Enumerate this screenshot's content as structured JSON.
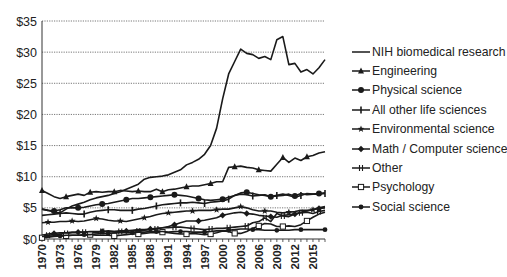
{
  "chart_data": {
    "type": "line",
    "title": "",
    "xlabel": "",
    "ylabel": "",
    "ylim": [
      0,
      35
    ],
    "y_ticks": [
      "$0",
      "$5",
      "$10",
      "$15",
      "$20",
      "$25",
      "$30",
      "$35"
    ],
    "y_tick_values": [
      0,
      5,
      10,
      15,
      20,
      25,
      30,
      35
    ],
    "x_tick_labels": [
      "1970",
      "1973",
      "1976",
      "1979",
      "1982",
      "1985",
      "1988",
      "1991",
      "1994",
      "1997",
      "2000",
      "2003",
      "2006",
      "2009",
      "2012",
      "2015"
    ],
    "grid": "horizontal dotted",
    "legend_position": "right",
    "x": [
      1970,
      1971,
      1972,
      1973,
      1974,
      1975,
      1976,
      1977,
      1978,
      1979,
      1980,
      1981,
      1982,
      1983,
      1984,
      1985,
      1986,
      1987,
      1988,
      1989,
      1990,
      1991,
      1992,
      1993,
      1994,
      1995,
      1996,
      1997,
      1998,
      1999,
      2000,
      2001,
      2002,
      2003,
      2004,
      2005,
      2006,
      2007,
      2008,
      2009,
      2010,
      2011,
      2012,
      2013,
      2014,
      2015,
      2016,
      2017
    ],
    "series": [
      {
        "name": "NIH biomedical research",
        "marker": "none",
        "values": [
          4.8,
          4.6,
          4.3,
          4.2,
          4.8,
          5.3,
          5.6,
          5.9,
          6.3,
          6.6,
          6.8,
          7.0,
          7.3,
          7.6,
          8.0,
          8.4,
          8.8,
          9.6,
          9.9,
          10.0,
          10.1,
          10.3,
          10.7,
          11.1,
          11.9,
          12.3,
          12.8,
          13.6,
          15.0,
          17.8,
          22.5,
          26.5,
          28.5,
          30.5,
          29.8,
          29.6,
          29.0,
          29.3,
          28.8,
          32.0,
          32.5,
          28.0,
          28.2,
          26.8,
          27.2,
          26.5,
          27.5,
          28.8
        ]
      },
      {
        "name": "Engineering",
        "marker": "triangle",
        "values": [
          7.8,
          7.3,
          6.8,
          6.5,
          6.8,
          7.0,
          7.2,
          7.0,
          7.5,
          7.6,
          7.5,
          7.6,
          7.6,
          7.8,
          7.7,
          7.6,
          7.7,
          7.6,
          7.6,
          8.0,
          7.6,
          7.9,
          8.0,
          8.2,
          8.4,
          8.5,
          8.5,
          8.7,
          8.9,
          9.2,
          9.2,
          11.5,
          11.6,
          11.7,
          11.5,
          11.4,
          11.1,
          11.0,
          10.9,
          12.0,
          13.1,
          12.3,
          13.0,
          12.6,
          13.2,
          13.4,
          13.8,
          14.0
        ]
      },
      {
        "name": "Physical science",
        "marker": "circle",
        "values": [
          4.8,
          4.6,
          4.5,
          4.7,
          5.0,
          5.0,
          5.0,
          5.1,
          5.3,
          5.5,
          5.6,
          5.7,
          5.9,
          6.1,
          6.3,
          6.5,
          6.5,
          6.6,
          6.7,
          6.8,
          6.9,
          7.0,
          7.1,
          7.0,
          6.9,
          6.7,
          6.5,
          6.3,
          6.2,
          6.3,
          6.4,
          6.7,
          7.0,
          7.4,
          7.5,
          7.3,
          7.1,
          7.0,
          6.8,
          6.9,
          7.0,
          7.2,
          6.9,
          7.3,
          7.1,
          7.2,
          7.3,
          7.4
        ]
      },
      {
        "name": "All other life sciences",
        "marker": "plus",
        "values": [
          3.8,
          3.9,
          4.0,
          4.1,
          4.2,
          4.1,
          4.0,
          4.0,
          4.3,
          4.5,
          4.6,
          4.7,
          4.7,
          4.6,
          4.6,
          4.6,
          4.8,
          4.9,
          5.1,
          5.3,
          5.5,
          5.6,
          5.7,
          5.8,
          5.8,
          5.9,
          5.8,
          5.7,
          5.9,
          6.0,
          6.1,
          6.4,
          7.0,
          7.2,
          7.1,
          6.9,
          7.0,
          7.1,
          6.8,
          7.0,
          7.2,
          7.0,
          6.7,
          7.0,
          7.3,
          7.2,
          7.2,
          7.3
        ]
      },
      {
        "name": "Environmental science",
        "marker": "star",
        "values": [
          2.6,
          2.7,
          2.7,
          2.8,
          2.8,
          2.9,
          2.8,
          2.9,
          3.1,
          3.3,
          3.2,
          3.0,
          2.9,
          2.9,
          2.8,
          3.0,
          3.2,
          3.4,
          3.6,
          3.9,
          4.1,
          4.2,
          4.3,
          4.4,
          4.5,
          4.5,
          4.6,
          4.6,
          4.6,
          4.7,
          4.8,
          4.8,
          5.0,
          5.2,
          5.0,
          4.7,
          4.5,
          4.5,
          4.5,
          4.3,
          4.2,
          4.3,
          4.4,
          4.6,
          4.6,
          4.7,
          5.0,
          5.2
        ]
      },
      {
        "name": "Math / Computer science",
        "marker": "diamond",
        "values": [
          0.6,
          0.8,
          0.9,
          1.0,
          1.0,
          1.1,
          1.1,
          1.1,
          1.2,
          1.2,
          1.2,
          1.2,
          1.2,
          1.3,
          1.3,
          1.4,
          1.5,
          1.5,
          1.6,
          1.7,
          1.8,
          2.0,
          2.3,
          2.6,
          2.9,
          2.9,
          2.9,
          3.0,
          3.2,
          3.4,
          3.8,
          4.0,
          4.2,
          4.3,
          4.1,
          4.0,
          3.8,
          3.7,
          3.6,
          3.5,
          3.8,
          3.9,
          4.0,
          4.3,
          4.5,
          4.7,
          4.9,
          5.0
        ]
      },
      {
        "name": "Other",
        "marker": "double-cross",
        "values": [
          0.5,
          0.6,
          0.7,
          0.8,
          0.9,
          1.0,
          1.0,
          1.1,
          1.1,
          1.0,
          1.2,
          1.3,
          1.2,
          1.2,
          1.3,
          1.3,
          1.3,
          1.4,
          1.5,
          1.6,
          1.8,
          1.8,
          1.9,
          1.9,
          1.8,
          1.7,
          1.6,
          1.5,
          1.6,
          1.7,
          1.7,
          1.8,
          1.9,
          2.0,
          2.1,
          2.6,
          2.8,
          3.4,
          2.8,
          4.1,
          3.7,
          3.6,
          4.0,
          4.2,
          4.3,
          4.1,
          4.4,
          4.6
        ]
      },
      {
        "name": "Psychology",
        "marker": "square-open",
        "values": [
          0.2,
          0.3,
          0.4,
          0.5,
          0.5,
          0.6,
          0.6,
          0.6,
          0.7,
          0.6,
          0.6,
          0.6,
          0.5,
          0.6,
          0.7,
          0.8,
          0.8,
          0.9,
          1.0,
          1.0,
          1.1,
          1.0,
          0.9,
          0.8,
          0.8,
          0.9,
          0.8,
          0.7,
          0.8,
          1.0,
          1.3,
          1.2,
          0.9,
          0.9,
          1.2,
          1.7,
          2.1,
          2.5,
          2.4,
          2.0,
          2.0,
          2.1,
          2.0,
          2.3,
          2.9,
          3.5,
          4.0,
          4.3
        ]
      },
      {
        "name": "Social science",
        "marker": "circle-small",
        "values": [
          0.4,
          0.4,
          0.5,
          0.5,
          0.6,
          0.6,
          0.6,
          0.7,
          0.7,
          0.8,
          0.9,
          0.9,
          1.0,
          1.0,
          1.0,
          1.0,
          1.1,
          1.1,
          1.2,
          1.2,
          1.2,
          1.1,
          1.2,
          1.2,
          1.2,
          1.1,
          1.1,
          1.1,
          1.2,
          1.3,
          1.3,
          1.4,
          1.5,
          1.6,
          1.6,
          1.5,
          1.5,
          1.4,
          1.4,
          1.4,
          1.4,
          1.4,
          1.5,
          1.5,
          1.5,
          1.5,
          1.5,
          1.5
        ]
      }
    ]
  }
}
